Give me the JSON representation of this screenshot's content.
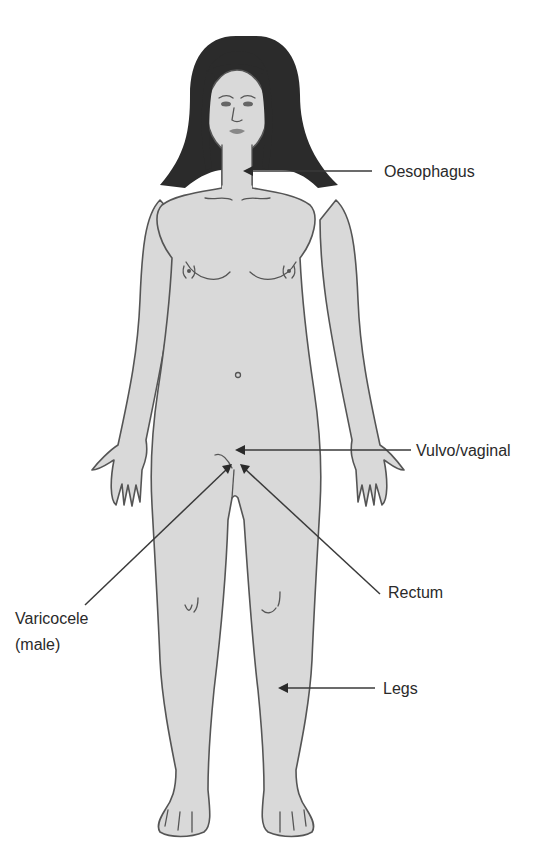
{
  "figure": {
    "colors": {
      "skin": "#d9d9d9",
      "outline": "#555555",
      "hair": "#2b2b2b",
      "leader_line": "#3a3a3a",
      "text": "#2a2a2a",
      "background": "#ffffff"
    }
  },
  "labels": {
    "oesophagus": "Oesophagus",
    "vulvo_vaginal": "Vulvo/vaginal",
    "rectum": "Rectum",
    "varicocele_line1": "Varicocele",
    "varicocele_line2": "(male)",
    "legs": "Legs"
  }
}
